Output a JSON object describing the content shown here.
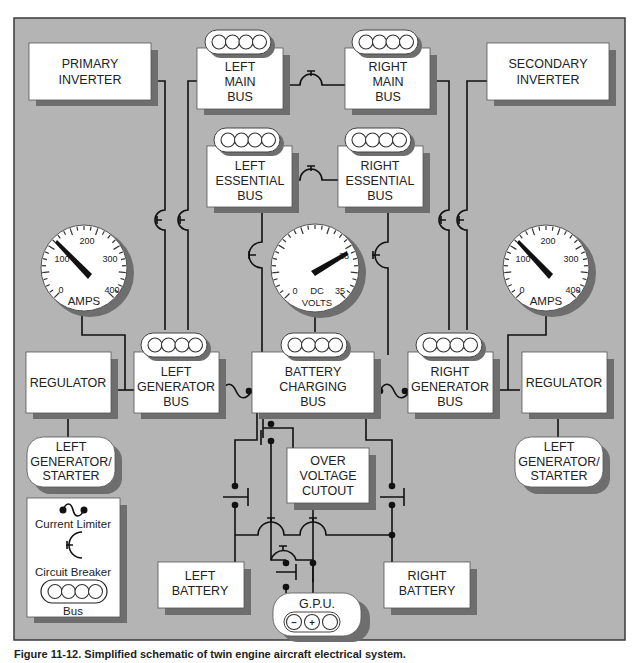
{
  "diagram": {
    "title": "Simplified schematic of twin engine aircraft electrical system",
    "background_color": "#b4b4b4",
    "box_color": "#ffffff",
    "shadow_color": "#6e6e6e",
    "wire_color": "#111111"
  },
  "components": {
    "primary_inverter": {
      "line1": "PRIMARY",
      "line2": "INVERTER"
    },
    "secondary_inverter": {
      "line1": "SECONDARY",
      "line2": "INVERTER"
    },
    "left_main_bus": {
      "line1": "LEFT",
      "line2": "MAIN",
      "line3": "BUS"
    },
    "right_main_bus": {
      "line1": "RIGHT",
      "line2": "MAIN",
      "line3": "BUS"
    },
    "left_essential_bus": {
      "line1": "LEFT",
      "line2": "ESSENTIAL",
      "line3": "BUS"
    },
    "right_essential_bus": {
      "line1": "RIGHT",
      "line2": "ESSENTIAL",
      "line3": "BUS"
    },
    "left_generator_bus": {
      "line1": "LEFT",
      "line2": "GENERATOR",
      "line3": "BUS"
    },
    "battery_charging_bus": {
      "line1": "BATTERY",
      "line2": "CHARGING",
      "line3": "BUS"
    },
    "right_generator_bus": {
      "line1": "RIGHT",
      "line2": "GENERATOR",
      "line3": "BUS"
    },
    "left_regulator": {
      "line1": "REGULATOR"
    },
    "right_regulator": {
      "line1": "REGULATOR"
    },
    "left_generator_starter": {
      "line1": "LEFT",
      "line2": "GENERATOR/",
      "line3": "STARTER"
    },
    "right_generator_starter": {
      "line1": "LEFT",
      "line2": "GENERATOR/",
      "line3": "STARTER"
    },
    "over_voltage_cutout": {
      "line1": "OVER",
      "line2": "VOLTAGE",
      "line3": "CUTOUT"
    },
    "left_battery": {
      "line1": "LEFT",
      "line2": "BATTERY"
    },
    "right_battery": {
      "line1": "RIGHT",
      "line2": "BATTERY"
    },
    "gpu": {
      "label": "G.P.U.",
      "minus": "−",
      "plus": "+"
    }
  },
  "gauges": {
    "left_ammeter": {
      "unit": "AMPS",
      "ticks": [
        "0",
        "100",
        "200",
        "300",
        "400"
      ],
      "reading": 100
    },
    "voltmeter": {
      "unit_line1": "DC",
      "unit_line2": "VOLTS",
      "ticks": [
        "0",
        "28",
        "35"
      ],
      "reading": 28
    },
    "right_ammeter": {
      "unit": "AMPS",
      "ticks": [
        "0",
        "100",
        "200",
        "300",
        "400"
      ],
      "reading": 100
    }
  },
  "legend": {
    "items": [
      {
        "symbol": "current-limiter",
        "label": "Current Limiter"
      },
      {
        "symbol": "circuit-breaker",
        "label": "Circuit Breaker"
      },
      {
        "symbol": "bus",
        "label": "Bus"
      }
    ]
  },
  "caption": "Figure 11-12. Simplified schematic of twin engine aircraft electrical system."
}
